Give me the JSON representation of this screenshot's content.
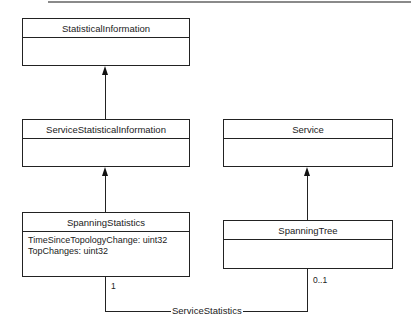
{
  "diagram": {
    "type": "UML class diagram",
    "classes": [
      {
        "name": "StatisticalInformation",
        "attributes": []
      },
      {
        "name": "ServiceStatisticalInformation",
        "attributes": []
      },
      {
        "name": "SpanningStatistics",
        "attributes": [
          "TimeSinceTopologyChange: uint32",
          "TopChanges: uint32"
        ]
      },
      {
        "name": "Service",
        "attributes": []
      },
      {
        "name": "SpanningTree",
        "attributes": []
      }
    ],
    "relations": [
      {
        "type": "generalization",
        "from": "ServiceStatisticalInformation",
        "to": "StatisticalInformation"
      },
      {
        "type": "generalization",
        "from": "SpanningStatistics",
        "to": "ServiceStatisticalInformation"
      },
      {
        "type": "generalization",
        "from": "SpanningTree",
        "to": "Service"
      },
      {
        "type": "association",
        "name": "ServiceStatistics",
        "from": "SpanningStatistics",
        "to": "SpanningTree",
        "from_multiplicity": "1",
        "to_multiplicity": "0..1"
      }
    ]
  }
}
